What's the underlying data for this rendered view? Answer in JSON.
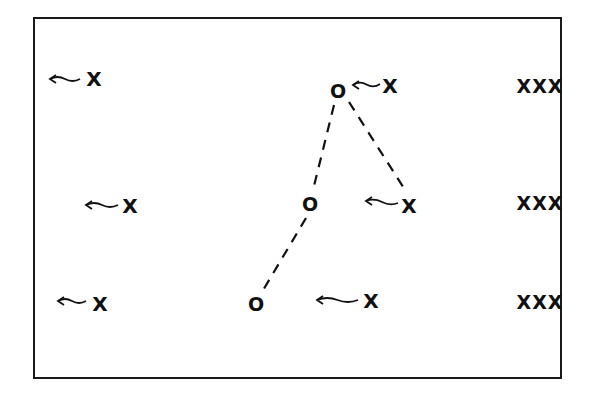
{
  "diagram": {
    "type": "play-diagram",
    "frame": {
      "left": 33,
      "top": 17,
      "right": 562,
      "bottom": 379
    },
    "offense": [
      {
        "id": "o1",
        "label": "O",
        "x": 338,
        "y": 91
      },
      {
        "id": "o2",
        "label": "O",
        "x": 310,
        "y": 204
      },
      {
        "id": "o3",
        "label": "O",
        "x": 256,
        "y": 304
      }
    ],
    "defenders": [
      {
        "id": "x1",
        "label": "X",
        "x": 94,
        "y": 79,
        "arrow": {
          "from": [
            80,
            79
          ],
          "to": [
            50,
            79
          ]
        }
      },
      {
        "id": "x2",
        "label": "X",
        "x": 130,
        "y": 206,
        "arrow": {
          "from": [
            118,
            205
          ],
          "to": [
            86,
            205
          ]
        }
      },
      {
        "id": "x3",
        "label": "X",
        "x": 100,
        "y": 304,
        "arrow": {
          "from": [
            86,
            301
          ],
          "to": [
            58,
            301
          ]
        }
      },
      {
        "id": "x4",
        "label": "X",
        "x": 390,
        "y": 86,
        "arrow": {
          "from": [
            380,
            84
          ],
          "to": [
            353,
            85
          ]
        }
      },
      {
        "id": "x5",
        "label": "X",
        "x": 409,
        "y": 206,
        "arrow": {
          "from": [
            398,
            203
          ],
          "to": [
            366,
            201
          ]
        }
      },
      {
        "id": "x6",
        "label": "X",
        "x": 371,
        "y": 301,
        "arrow": {
          "from": [
            358,
            300
          ],
          "to": [
            317,
            300
          ]
        }
      }
    ],
    "groups": [
      {
        "id": "g1",
        "label": "XXX",
        "x": 540,
        "y": 86
      },
      {
        "id": "g2",
        "label": "XXX",
        "x": 540,
        "y": 203
      },
      {
        "id": "g3",
        "label": "XXX",
        "x": 540,
        "y": 302
      }
    ],
    "dashed_links": [
      {
        "from": [
          334,
          105
        ],
        "to": [
          313,
          190
        ]
      },
      {
        "from": [
          306,
          218
        ],
        "to": [
          262,
          292
        ]
      },
      {
        "from": [
          349,
          102
        ],
        "to": [
          407,
          193
        ]
      }
    ],
    "colors": {
      "ink": "#111111",
      "background": "#ffffff"
    }
  }
}
